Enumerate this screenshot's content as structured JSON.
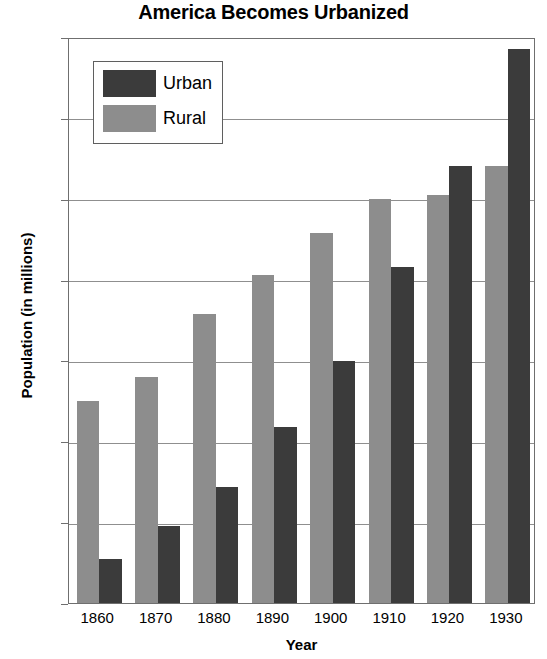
{
  "chart_data": {
    "type": "bar",
    "title": "America Becomes Urbanized",
    "xlabel": "Year",
    "ylabel": "Population (in millions)",
    "categories": [
      "1860",
      "1870",
      "1880",
      "1890",
      "1900",
      "1910",
      "1920",
      "1930"
    ],
    "series": [
      {
        "name": "Rural",
        "color": "#8d8d8d",
        "values": [
          25.0,
          28.0,
          35.7,
          40.6,
          45.7,
          50.0,
          50.5,
          54.0
        ]
      },
      {
        "name": "Urban",
        "color": "#3b3b3b",
        "values": [
          5.5,
          9.5,
          14.4,
          21.8,
          29.9,
          41.6,
          54.0,
          68.5
        ]
      }
    ],
    "series_draw_order": [
      "Rural",
      "Urban"
    ],
    "ylim": [
      0,
      70
    ],
    "yticks": [
      0,
      10,
      20,
      30,
      40,
      50,
      60,
      70
    ],
    "ytick_labels": [
      "0",
      "10",
      "20",
      "30",
      "40",
      "50",
      "60",
      "70"
    ],
    "grid": "horizontal",
    "legend_position": "top-left",
    "legend_entries": [
      {
        "label": "Urban",
        "color": "#3b3b3b"
      },
      {
        "label": "Rural",
        "color": "#8d8d8d"
      }
    ]
  }
}
